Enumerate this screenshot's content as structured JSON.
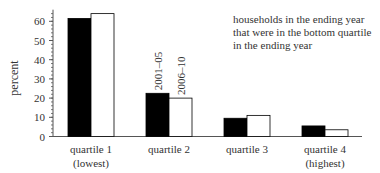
{
  "chart_data": {
    "type": "bar",
    "title": "",
    "annotation": [
      "households in the ending year",
      "that were in the bottom quartile",
      "in the ending year"
    ],
    "xlabel": "",
    "ylabel": "percent",
    "ylim": [
      0,
      65
    ],
    "yticks": [
      0,
      10,
      20,
      30,
      40,
      50,
      60
    ],
    "categories": [
      [
        "quartile 1",
        "(lowest)"
      ],
      [
        "quartile 2"
      ],
      [
        "quartile 3"
      ],
      [
        "quartile 4",
        "(highest)"
      ]
    ],
    "series": [
      {
        "name": "2001–05",
        "color": "#000000",
        "values": [
          61.5,
          22.5,
          9.5,
          5.5
        ]
      },
      {
        "name": "2006–10",
        "color": "#ffffff",
        "values": [
          64,
          20,
          11,
          3.5
        ]
      }
    ],
    "series_labels_on": "quartile 2",
    "grid": false,
    "legend": "inline-rotated"
  }
}
